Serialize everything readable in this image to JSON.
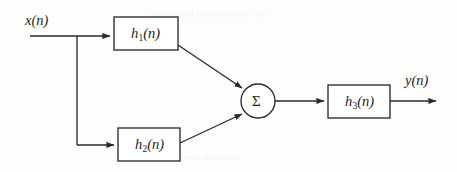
{
  "figure": {
    "type": "block-diagram",
    "domain": "signal-processing",
    "background_color": "#fdfdfc",
    "line_color": "#2a2a2a",
    "text_color": "#1d1d1d"
  },
  "signals": {
    "input": {
      "label_var": "x",
      "label_arg": "(n)",
      "label": "x(n)"
    },
    "output": {
      "label_var": "y",
      "label_arg": "(n)",
      "label": "y(n)"
    }
  },
  "blocks": [
    {
      "id": "h1",
      "var": "h",
      "sub": "1",
      "arg": "(n)",
      "label": "h1(n)",
      "x": 114,
      "y": 17,
      "w": 64,
      "h": 33
    },
    {
      "id": "h2",
      "var": "h",
      "sub": "2",
      "arg": "(n)",
      "label": "h2(n)",
      "x": 118,
      "y": 128,
      "w": 62,
      "h": 33
    },
    {
      "id": "h3",
      "var": "h",
      "sub": "3",
      "arg": "(n)",
      "label": "h3(n)",
      "x": 328,
      "y": 85,
      "w": 62,
      "h": 33
    }
  ],
  "adder": {
    "id": "sum",
    "symbol": "Σ",
    "cx": 258,
    "cy": 101,
    "r": 17
  },
  "ghost_text": {
    "line1": "the parallel connection of two",
    "line2": "systems in cascade"
  }
}
